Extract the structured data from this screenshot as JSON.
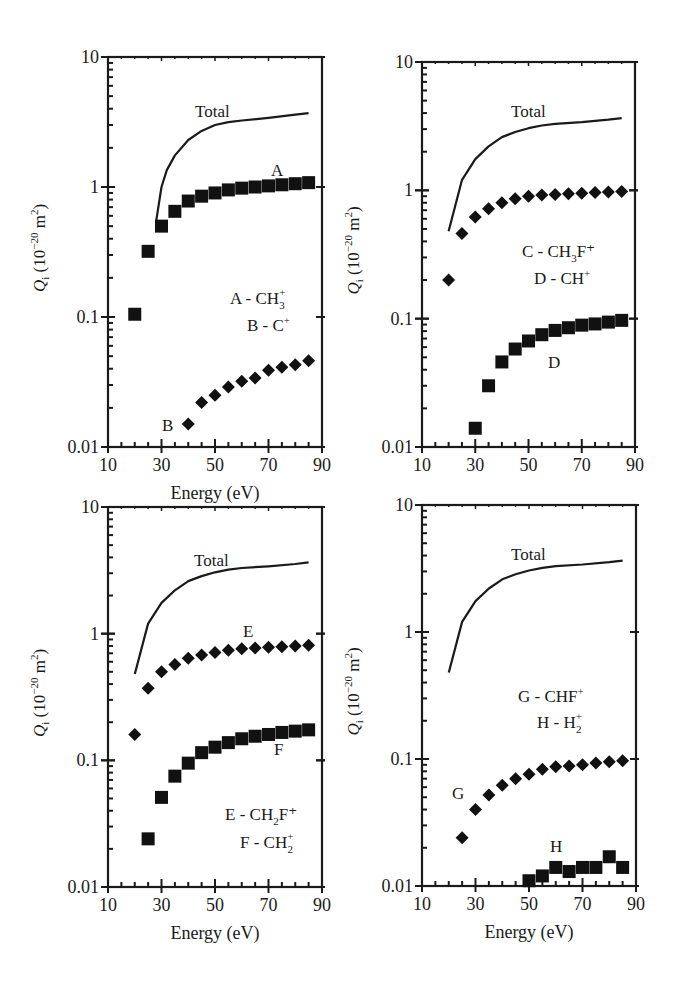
{
  "figure": {
    "xlabel": "Energy (eV)",
    "ylabel_main": "Q",
    "ylabel_sub": "i",
    "ylabel_unit_pre": " (10",
    "ylabel_unit_exp": "−20",
    "ylabel_unit_post": " m",
    "ylabel_unit_exp2": "2",
    "ylabel_close": ")",
    "x_ticks": [
      "10",
      "30",
      "50",
      "70",
      "90"
    ],
    "y_ticks": [
      "0.01",
      "0.1",
      "1",
      "10"
    ]
  },
  "chart_data": [
    {
      "type": "scatter",
      "title": "",
      "xlabel": "Energy (eV)",
      "ylabel": "Q_i (10^-20 m^2)",
      "xlim": [
        10,
        90
      ],
      "ylim": [
        0.01,
        10
      ],
      "yscale": "log",
      "legend": [
        "A - CH3+",
        "B - C+"
      ],
      "annotations": [
        "Total",
        "A",
        "B"
      ],
      "series": [
        {
          "name": "Total",
          "style": "line",
          "x": [
            28,
            30,
            32,
            35,
            40,
            45,
            50,
            55,
            60,
            70,
            80,
            85
          ],
          "values": [
            0.55,
            1.0,
            1.35,
            1.75,
            2.3,
            2.7,
            3.0,
            3.15,
            3.25,
            3.4,
            3.6,
            3.7
          ]
        },
        {
          "name": "A - CH3+",
          "marker": "square",
          "x": [
            20,
            25,
            30,
            35,
            40,
            45,
            50,
            55,
            60,
            65,
            70,
            75,
            80,
            85
          ],
          "values": [
            0.105,
            0.32,
            0.5,
            0.65,
            0.78,
            0.85,
            0.9,
            0.95,
            0.98,
            1.0,
            1.02,
            1.04,
            1.06,
            1.08
          ]
        },
        {
          "name": "B - C+",
          "marker": "diamond",
          "x": [
            40,
            45,
            50,
            55,
            60,
            65,
            70,
            75,
            80,
            85
          ],
          "values": [
            0.015,
            0.022,
            0.025,
            0.029,
            0.032,
            0.034,
            0.039,
            0.041,
            0.043,
            0.046
          ]
        }
      ]
    },
    {
      "type": "scatter",
      "title": "",
      "xlabel": "",
      "ylabel": "Q_i (10^-20 m^2)",
      "xlim": [
        10,
        90
      ],
      "ylim": [
        0.01,
        10
      ],
      "yscale": "log",
      "legend": [
        "C - CH3F+",
        "D - CH+"
      ],
      "annotations": [
        "Total",
        "D"
      ],
      "series": [
        {
          "name": "Total",
          "style": "line",
          "x": [
            20,
            25,
            30,
            35,
            40,
            45,
            50,
            55,
            60,
            70,
            80,
            85
          ],
          "values": [
            0.48,
            1.2,
            1.75,
            2.2,
            2.6,
            2.85,
            3.05,
            3.2,
            3.3,
            3.4,
            3.55,
            3.65
          ]
        },
        {
          "name": "C - CH3F+",
          "marker": "diamond",
          "x": [
            20,
            25,
            30,
            35,
            40,
            45,
            50,
            55,
            60,
            65,
            70,
            75,
            80,
            85
          ],
          "values": [
            0.2,
            0.46,
            0.62,
            0.72,
            0.8,
            0.86,
            0.9,
            0.92,
            0.93,
            0.94,
            0.95,
            0.96,
            0.97,
            0.98
          ]
        },
        {
          "name": "D - CH+",
          "marker": "square",
          "x": [
            30,
            35,
            40,
            45,
            50,
            55,
            60,
            65,
            70,
            75,
            80,
            85
          ],
          "values": [
            0.014,
            0.03,
            0.046,
            0.058,
            0.067,
            0.075,
            0.081,
            0.085,
            0.089,
            0.091,
            0.094,
            0.097
          ]
        }
      ]
    },
    {
      "type": "scatter",
      "title": "",
      "xlabel": "Energy (eV)",
      "ylabel": "Q_i (10^-20 m^2)",
      "xlim": [
        10,
        90
      ],
      "ylim": [
        0.01,
        10
      ],
      "yscale": "log",
      "legend": [
        "E - CH2F+",
        "F - CH2+"
      ],
      "annotations": [
        "Total",
        "E",
        "F"
      ],
      "series": [
        {
          "name": "Total",
          "style": "line",
          "x": [
            20,
            25,
            30,
            35,
            40,
            45,
            50,
            55,
            60,
            70,
            80,
            85
          ],
          "values": [
            0.48,
            1.2,
            1.75,
            2.2,
            2.6,
            2.85,
            3.05,
            3.2,
            3.3,
            3.4,
            3.55,
            3.65
          ]
        },
        {
          "name": "E - CH2F+",
          "marker": "diamond",
          "x": [
            20,
            25,
            30,
            35,
            40,
            45,
            50,
            55,
            60,
            65,
            70,
            75,
            80,
            85
          ],
          "values": [
            0.16,
            0.37,
            0.5,
            0.57,
            0.64,
            0.68,
            0.71,
            0.74,
            0.76,
            0.77,
            0.78,
            0.79,
            0.8,
            0.81
          ]
        },
        {
          "name": "F - CH2+",
          "marker": "square",
          "x": [
            25,
            30,
            35,
            40,
            45,
            50,
            55,
            60,
            65,
            70,
            75,
            80,
            85
          ],
          "values": [
            0.024,
            0.051,
            0.075,
            0.095,
            0.115,
            0.127,
            0.138,
            0.148,
            0.155,
            0.16,
            0.166,
            0.17,
            0.174
          ]
        }
      ]
    },
    {
      "type": "scatter",
      "title": "",
      "xlabel": "Energy (eV)",
      "ylabel": "Q_i (10^-20 m^2)",
      "xlim": [
        10,
        90
      ],
      "ylim": [
        0.01,
        10
      ],
      "yscale": "log",
      "legend": [
        "G - CHF+",
        "H - H2+"
      ],
      "annotations": [
        "Total",
        "G",
        "H"
      ],
      "series": [
        {
          "name": "Total",
          "style": "line",
          "x": [
            20,
            25,
            30,
            35,
            40,
            45,
            50,
            55,
            60,
            70,
            80,
            85
          ],
          "values": [
            0.48,
            1.2,
            1.75,
            2.2,
            2.6,
            2.85,
            3.05,
            3.2,
            3.3,
            3.4,
            3.55,
            3.65
          ]
        },
        {
          "name": "G - CHF+",
          "marker": "diamond",
          "x": [
            25,
            30,
            35,
            40,
            45,
            50,
            55,
            60,
            65,
            70,
            75,
            80,
            85
          ],
          "values": [
            0.024,
            0.04,
            0.052,
            0.062,
            0.07,
            0.076,
            0.083,
            0.087,
            0.088,
            0.09,
            0.093,
            0.095,
            0.097
          ]
        },
        {
          "name": "H - H2+",
          "marker": "square",
          "x": [
            50,
            55,
            60,
            65,
            70,
            75,
            80,
            85
          ],
          "values": [
            0.011,
            0.012,
            0.014,
            0.013,
            0.014,
            0.014,
            0.017,
            0.014
          ]
        }
      ]
    }
  ],
  "panels": [
    {
      "legend1_pre": "A - CH",
      "legend1_sub": "3",
      "legend1_sup": "+",
      "legend1_post": "",
      "legend2_pre": "B - C",
      "legend2_sub": "",
      "legend2_sup": "+",
      "legend2_post": "",
      "labels": [
        {
          "text": "Total"
        },
        {
          "text": "A"
        },
        {
          "text": "B"
        }
      ]
    },
    {
      "legend1_pre": "C - CH",
      "legend1_sub": "3",
      "legend1_sup": "",
      "legend1_post": "F⁺",
      "legend2_pre": "D - CH",
      "legend2_sub": "",
      "legend2_sup": "+",
      "legend2_post": "",
      "labels": [
        {
          "text": "Total"
        },
        {
          "text": "D"
        }
      ]
    },
    {
      "legend1_pre": "E - CH",
      "legend1_sub": "2",
      "legend1_sup": "",
      "legend1_post": "F⁺",
      "legend2_pre": "F - CH",
      "legend2_sub": "2",
      "legend2_sup": "+",
      "legend2_post": "",
      "labels": [
        {
          "text": "Total"
        },
        {
          "text": "E"
        },
        {
          "text": "F"
        }
      ]
    },
    {
      "legend1_pre": "G - CHF",
      "legend1_sub": "",
      "legend1_sup": "+",
      "legend1_post": "",
      "legend2_pre": "H - H",
      "legend2_sub": "2",
      "legend2_sup": "+",
      "legend2_post": "",
      "labels": [
        {
          "text": "Total"
        },
        {
          "text": "G"
        },
        {
          "text": "H"
        }
      ]
    }
  ]
}
